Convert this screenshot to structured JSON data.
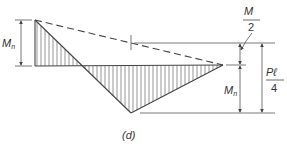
{
  "diagram": {
    "type": "moment-diagram",
    "caption": "(d)",
    "labels": {
      "left_dim": "M",
      "left_dim_sub": "n",
      "right_inner_dim": "M",
      "right_inner_dim_sub": "n",
      "half_top_num": "M",
      "half_top_num_sub": "n",
      "half_top_den": "2",
      "pl_num": "Pℓ",
      "pl_den": "4"
    },
    "colors": {
      "line": "#444444",
      "hatch": "#555555",
      "text": "#333333"
    }
  }
}
